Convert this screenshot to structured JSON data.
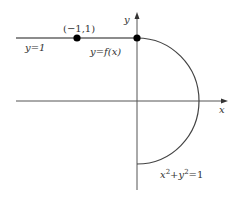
{
  "diagram": {
    "type": "function-graph",
    "colors": {
      "line": "#555555",
      "curve": "#444444",
      "point": "#000000",
      "text": "#333333"
    },
    "axes": {
      "x_label": "x",
      "y_label": "y"
    },
    "labels": {
      "line_y1": "y=1",
      "point_neg1_1": "(−1,1)",
      "function": "y=f(x)",
      "circle_eq_x": "x",
      "circle_eq_sup1": "2",
      "circle_eq_plus": "+y",
      "circle_eq_sup2": "2",
      "circle_eq_rhs": "=1"
    },
    "points": [
      {
        "name": "(-1,1)",
        "x": -1,
        "y": 1
      },
      {
        "name": "(0,1)",
        "x": 0,
        "y": 1
      }
    ],
    "segments": [
      {
        "description": "horizontal line y=1 for x<=0"
      },
      {
        "description": "right semicircle x^2+y^2=1 for x>=0, from (0,1) to (0,-1)"
      }
    ]
  }
}
